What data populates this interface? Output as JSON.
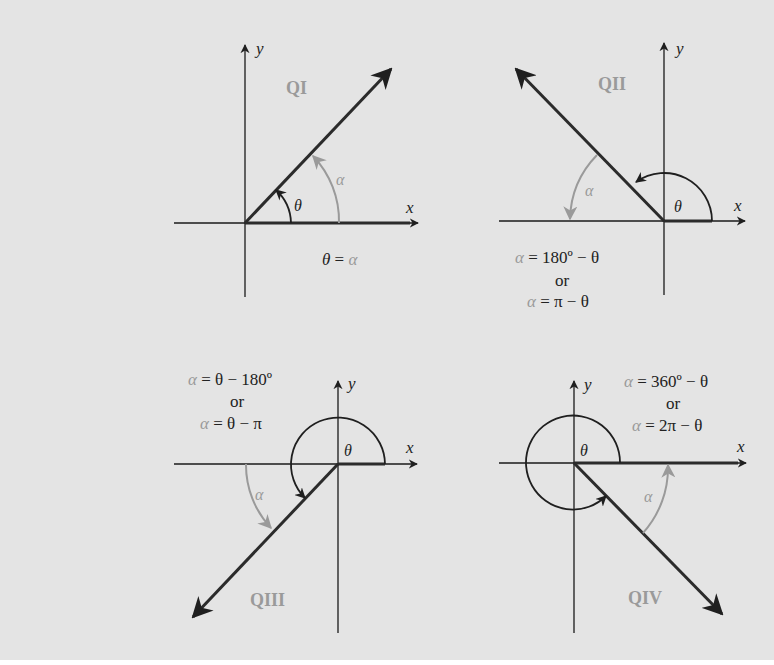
{
  "colors": {
    "background": "#e4e4e4",
    "axis": "#1a1a1a",
    "terminal_side": "#2b2b2b",
    "reference_angle": "#9a9a9a",
    "quadrant_label": "#9a9a9a"
  },
  "axis_labels": {
    "x": "x",
    "y": "y"
  },
  "panels": [
    {
      "id": "q1",
      "quadrant_label": "QI",
      "theta_label": "θ",
      "alpha_label": "α",
      "formula": {
        "lhs": "θ",
        "eq": " = ",
        "rhs": "α"
      }
    },
    {
      "id": "q2",
      "quadrant_label": "QII",
      "theta_label": "θ",
      "alpha_label": "α",
      "formula_line1": {
        "alpha": "α",
        "rest": " = 180º − θ"
      },
      "or_label": "or",
      "formula_line2": {
        "alpha": "α",
        "rest": " = π − θ"
      }
    },
    {
      "id": "q3",
      "quadrant_label": "QIII",
      "theta_label": "θ",
      "alpha_label": "α",
      "formula_line1": {
        "alpha": "α",
        "rest": " = θ − 180º"
      },
      "or_label": "or",
      "formula_line2": {
        "alpha": "α",
        "rest": " = θ − π"
      }
    },
    {
      "id": "q4",
      "quadrant_label": "QIV",
      "theta_label": "θ",
      "alpha_label": "α",
      "formula_line1": {
        "alpha": "α",
        "rest": " = 360º − θ"
      },
      "or_label": "or",
      "formula_line2": {
        "alpha": "α",
        "rest": " = 2π − θ"
      }
    }
  ]
}
